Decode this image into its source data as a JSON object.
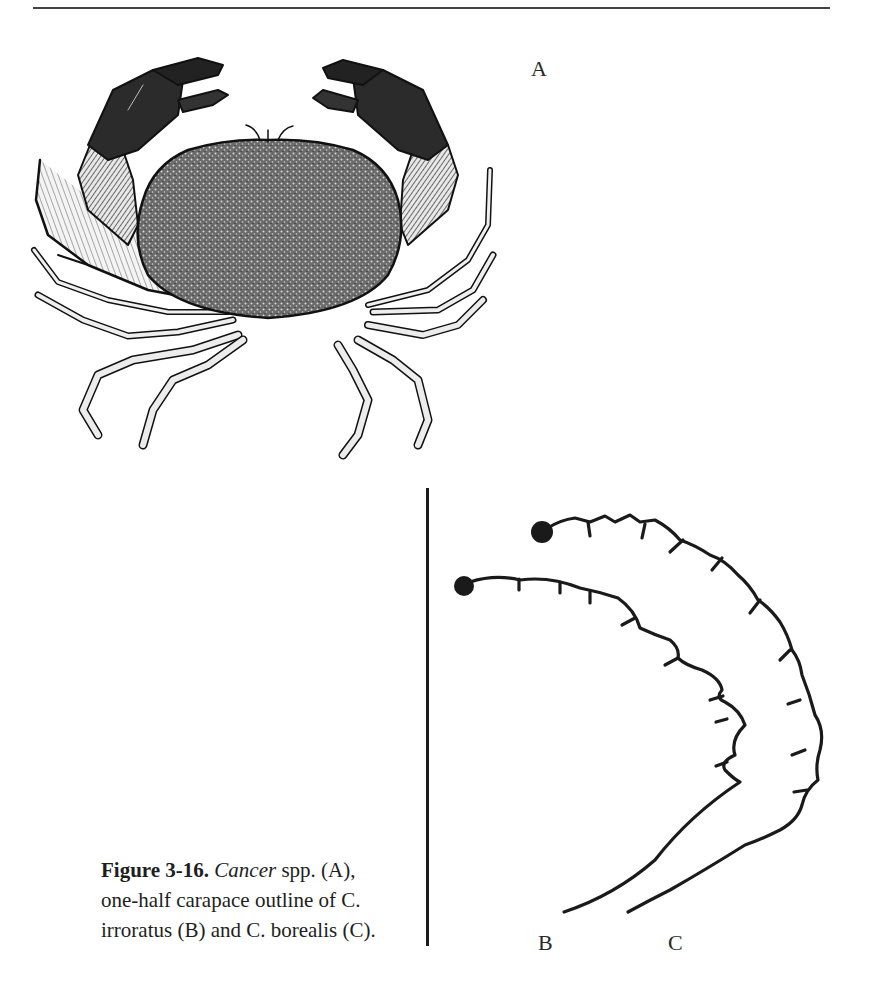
{
  "figure": {
    "number_label": "Figure 3-16.",
    "genus_italic": "Cancer",
    "caption_rest_line1": " spp. (A),",
    "caption_line2": "one-half carapace outline of C.",
    "caption_line3": "irroratus (B) and C. borealis (C).",
    "panels": {
      "a": {
        "label": "A",
        "content": "Cancer spp. crab illustration (dorsal view)"
      },
      "b": {
        "label": "B",
        "content": "one-half carapace outline of C. irroratus"
      },
      "c": {
        "label": "C",
        "content": "one-half carapace outline of C. borealis"
      }
    }
  },
  "colors": {
    "ink": "#1a1a1a",
    "paper": "#ffffff"
  }
}
